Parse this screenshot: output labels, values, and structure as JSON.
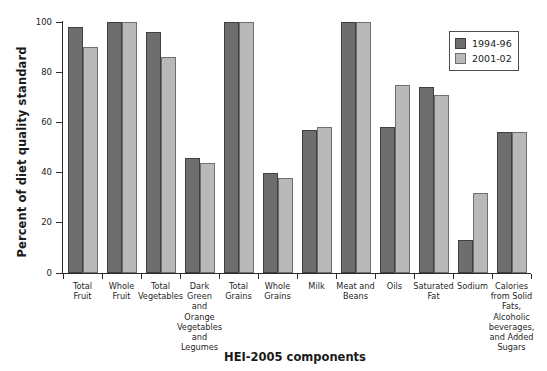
{
  "chart_data": {
    "type": "bar",
    "title": "",
    "xlabel": "HEI-2005 components",
    "ylabel": "Percent of diet quality standard",
    "ylim": [
      0,
      100
    ],
    "yticks": [
      0,
      20,
      40,
      60,
      80,
      100
    ],
    "grid": false,
    "legend_position": "top-right",
    "categories": [
      "Total\nFruit",
      "Whole\nFruit",
      "Total\nVegetables",
      "Dark\nGreen\nand\nOrange\nVegetables\nand\nLegumes",
      "Total\nGrains",
      "Whole\nGrains",
      "Milk",
      "Meat and\nBeans",
      "Oils",
      "Saturated\nFat",
      "Sodium",
      "Calories\nfrom Solid\nFats,\nAlcoholic\nbeverages,\nand Added\nSugars"
    ],
    "series": [
      {
        "name": "1994-96",
        "color": "#6e6e6e",
        "values": [
          98,
          100,
          96,
          46,
          100,
          40,
          57,
          100,
          58,
          74,
          13,
          56
        ]
      },
      {
        "name": "2001-02",
        "color": "#b9b9b9",
        "values": [
          90,
          100,
          86,
          44,
          100,
          38,
          58,
          100,
          75,
          71,
          32,
          56
        ]
      }
    ]
  }
}
